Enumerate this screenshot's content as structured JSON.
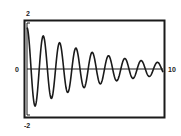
{
  "chart_data": {
    "type": "line",
    "title": "",
    "xlabel": "",
    "ylabel": "",
    "xlim": [
      0,
      10
    ],
    "ylim": [
      -2,
      2
    ],
    "grid": false,
    "legend": null,
    "tick_labels": {
      "y_top": "2",
      "y_bottom": "-2",
      "y_zero": "0",
      "x_right": "10"
    },
    "series": [
      {
        "name": "damped oscillation",
        "function": "y = 1.8 * exp(-0.19 x) * cos(2*pi*x/1.2)",
        "x": [
          0,
          0.3,
          0.6,
          0.9,
          1.2,
          1.5,
          1.8,
          2.1,
          2.4,
          2.7,
          3.0,
          3.3,
          3.6,
          3.9,
          4.2,
          4.5,
          4.8,
          5.1,
          5.4,
          5.7,
          6.0,
          6.3,
          6.6,
          6.9,
          7.2,
          7.5,
          7.8,
          8.1,
          8.4,
          8.7,
          9.0,
          9.3,
          9.6,
          9.9,
          10.0
        ],
        "values": [
          1.8,
          0.0,
          -1.6,
          0.0,
          1.43,
          0.0,
          -1.27,
          0.0,
          1.14,
          0.0,
          -1.01,
          0.0,
          0.9,
          0.0,
          -0.81,
          0.0,
          0.72,
          0.0,
          -0.64,
          0.0,
          0.57,
          0.0,
          -0.51,
          0.0,
          0.46,
          0.0,
          -0.41,
          0.0,
          0.36,
          0.0,
          -0.32,
          0.0,
          0.29,
          0.0,
          0.1
        ]
      }
    ],
    "colors": {
      "line": "#1a1a1a",
      "frame": "#1a1a1a",
      "background": "#ffffff"
    }
  }
}
